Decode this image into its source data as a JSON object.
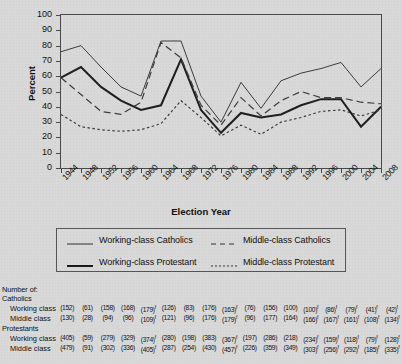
{
  "chart_data": {
    "type": "line",
    "title": "",
    "xlabel": "Election Year",
    "ylabel": "Percent",
    "ylim": [
      0,
      100
    ],
    "ytick_values": [
      0,
      10,
      20,
      30,
      40,
      50,
      60,
      70,
      80,
      90,
      100
    ],
    "grid": false,
    "legend_position": "below-plot",
    "categories": [
      "1944",
      "1948",
      "1952",
      "1956",
      "1960",
      "1964",
      "1968",
      "1972",
      "1976",
      "1980",
      "1984",
      "1988",
      "1992",
      "1996",
      "2000",
      "2004",
      "2008"
    ],
    "series": [
      {
        "name": "Working-class Catholics",
        "style": "solid-thin",
        "color": "#3d3d3d",
        "values": [
          76,
          80,
          66,
          53,
          47,
          83,
          83,
          47,
          30,
          56,
          39,
          57,
          62,
          65,
          69,
          53,
          65
        ]
      },
      {
        "name": "Working-class Protestant",
        "style": "solid-thick",
        "color": "#1f1f1f",
        "values": [
          59,
          66,
          53,
          44,
          38,
          41,
          71,
          38,
          23,
          36,
          33,
          35,
          41,
          45,
          45,
          27,
          40
        ]
      },
      {
        "name": "Middle-class Catholics",
        "style": "dashed",
        "color": "#3d3d3d",
        "values": [
          59,
          48,
          37,
          35,
          43,
          82,
          72,
          41,
          28,
          46,
          34,
          44,
          50,
          46,
          46,
          43,
          42
        ]
      },
      {
        "name": "Middle-class Protestant",
        "style": "dotted",
        "color": "#3d3d3d",
        "values": [
          35,
          27,
          25,
          24,
          25,
          29,
          44,
          33,
          21,
          28,
          22,
          30,
          33,
          37,
          38,
          34,
          38
        ]
      }
    ]
  },
  "axes": {
    "y_title": "Percent",
    "x_title": "Election Year",
    "y_ticks": [
      "100",
      "90",
      "80",
      "70",
      "60",
      "50",
      "40",
      "30",
      "20",
      "10",
      "0"
    ],
    "x_ticks": [
      "1944",
      "1948",
      "1952",
      "1956",
      "1960",
      "1964",
      "1968",
      "1972",
      "1976",
      "1980",
      "1984",
      "1988",
      "1992",
      "1996",
      "2000",
      "2004",
      "2008"
    ]
  },
  "legend": {
    "entries": [
      {
        "label": "Working-class Catholics",
        "style": "solid-thin"
      },
      {
        "label": "Middle-class Catholics",
        "style": "dashed"
      },
      {
        "label": "Working-class Protestant",
        "style": "solid-thick"
      },
      {
        "label": "Middle-class Protestant",
        "style": "dotted"
      }
    ]
  },
  "table": {
    "caption": "Number of:",
    "groups": [
      {
        "name": "Catholics",
        "rows": [
          {
            "label": "Working class",
            "values": [
              "(152)",
              "(61)",
              "(158)",
              "(168)",
              "(179)ᶠ",
              "(126)",
              "(83)",
              "(176)",
              "(163)ᶠ",
              "(76)",
              "(156)",
              "(100)",
              "(100)ᶠ",
              "(86)ᶠ",
              "(79)ᶠ",
              "(41)ᶠ",
              "(42)ᶠ"
            ]
          },
          {
            "label": "Middle class",
            "values": [
              "(130)",
              "(28)",
              "(94)",
              "(96)",
              "(109)ᶠ",
              "(121)",
              "(96)",
              "(176)",
              "(179)ᶠ",
              "(96)",
              "(177)",
              "(164)",
              "(166)ᶠ",
              "(167)ᶠ",
              "(161)ᶠ",
              "(108)ᶠ",
              "(134)ᶠ"
            ]
          }
        ]
      },
      {
        "name": "Protestants",
        "rows": [
          {
            "label": "Working class",
            "values": [
              "(405)",
              "(59)",
              "(279)",
              "(329)",
              "(374)ᶠ",
              "(280)",
              "(198)",
              "(383)",
              "(367)ᶠ",
              "(197)",
              "(286)",
              "(218)",
              "(234)ᶠ",
              "(159)ᶠ",
              "(118)ᶠ",
              "(79)ᶠ",
              "(128)ᶠ"
            ]
          },
          {
            "label": "Middle class",
            "values": [
              "(479)",
              "(91)",
              "(302)",
              "(336)",
              "(405)ᶠ",
              "(287)",
              "(254)",
              "(430)",
              "(457)ᶠ",
              "(226)",
              "(359)",
              "(349)",
              "(303)ᶠ",
              "(256)ᶠ",
              "(292)ᶠ",
              "(185)ᶠ",
              "(335)ᶠ"
            ]
          }
        ]
      }
    ]
  },
  "colors": {
    "background": "#d8d8d8",
    "axis": "#4a4a4a",
    "text": "#111111"
  }
}
